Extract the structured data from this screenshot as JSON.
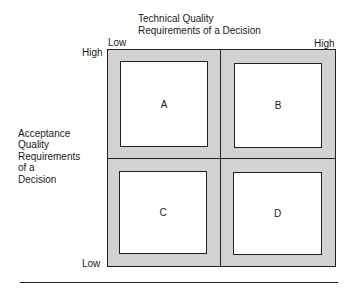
{
  "diagram": {
    "x_axis": {
      "title_line1": "Technical Quality",
      "title_line2": "Requirements of a Decision",
      "low_label": "Low",
      "high_label": "High"
    },
    "y_axis": {
      "title_lines": [
        "Acceptance",
        "Quality",
        "Requirements",
        "of a",
        "Decision"
      ],
      "high_label": "High",
      "low_label": "Low"
    },
    "quadrants": [
      {
        "id": "A",
        "label": "A",
        "position": "top-left"
      },
      {
        "id": "B",
        "label": "B",
        "position": "top-right"
      },
      {
        "id": "C",
        "label": "C",
        "position": "bottom-left"
      },
      {
        "id": "D",
        "label": "D",
        "position": "bottom-right"
      }
    ],
    "colors": {
      "frame_fill": "#d2d2d2",
      "cell_fill": "#ffffff",
      "line": "#222222"
    }
  }
}
